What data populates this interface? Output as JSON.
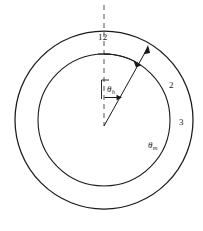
{
  "diagram": {
    "background_color": "#ffffff",
    "stroke_color": "#1a1a1a",
    "labels": {
      "twelve": "12",
      "region_two": "2",
      "region_three": "3",
      "theta_h_symbol": "θ",
      "theta_h_subscript": "h",
      "theta_m_symbol": "θ",
      "theta_m_subscript": "m"
    },
    "geometry": {
      "center_x": 104,
      "center_y": 120,
      "outer_radius": 89,
      "inner_radius": 66,
      "ray_angle_deg_from_vertical": 37,
      "theta_h_arc_angle_deg": 37,
      "dashed_line_top_y": 5
    }
  }
}
